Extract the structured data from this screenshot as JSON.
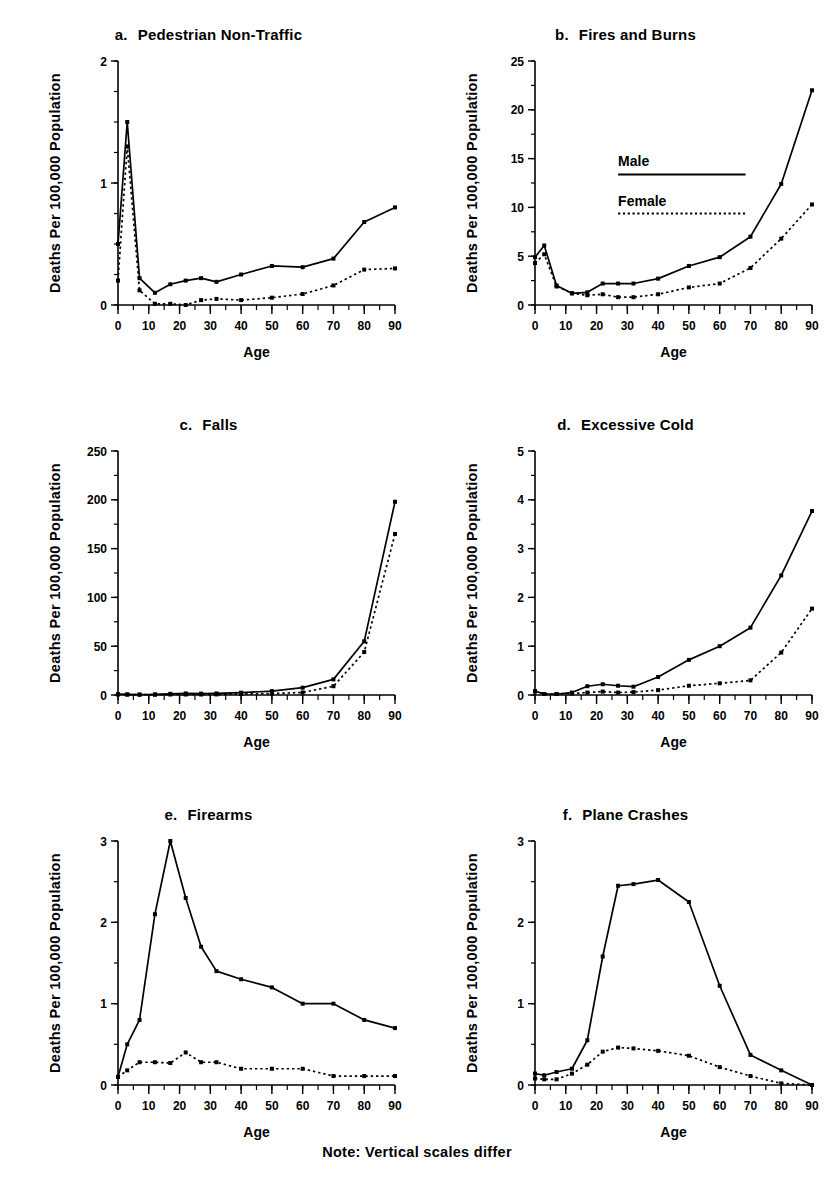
{
  "figure": {
    "footnote": "Note: Vertical scales differ",
    "axis_x_title": "Age",
    "axis_y_title": "Deaths Per 100,000 Population",
    "ink_color": "#000000",
    "background_color": "#ffffff"
  },
  "legend": {
    "male_label": "Male",
    "female_label": "Female",
    "panel": "b"
  },
  "chart_data": [
    {
      "type": "line",
      "panel_letter": "a.",
      "title": "Pedestrian Non-Traffic",
      "xlabel": "Age",
      "ylabel": "Deaths Per 100,000 Population",
      "xlim": [
        0,
        90
      ],
      "ylim": [
        0,
        2
      ],
      "xticks": [
        0,
        10,
        20,
        30,
        40,
        50,
        60,
        70,
        80,
        90
      ],
      "xticks_minor_step": 5,
      "yticks": [
        0,
        1,
        2
      ],
      "yticks_minor_step": 0.25,
      "grid": false,
      "legend_position": "none",
      "x": [
        0,
        3,
        7,
        12,
        17,
        22,
        27,
        32,
        40,
        50,
        60,
        70,
        80,
        90
      ],
      "series": [
        {
          "name": "Male",
          "style": "solid",
          "values": [
            0.5,
            1.5,
            0.22,
            0.1,
            0.17,
            0.2,
            0.22,
            0.19,
            0.25,
            0.32,
            0.31,
            0.38,
            0.68,
            0.8
          ]
        },
        {
          "name": "Female",
          "style": "dotted",
          "values": [
            0.2,
            1.3,
            0.12,
            0.01,
            0.01,
            0.0,
            0.04,
            0.05,
            0.04,
            0.06,
            0.09,
            0.16,
            0.29,
            0.3
          ]
        }
      ]
    },
    {
      "type": "line",
      "panel_letter": "b.",
      "title": "Fires and Burns",
      "xlabel": "Age",
      "ylabel": "Deaths Per 100,000 Population",
      "xlim": [
        0,
        90
      ],
      "ylim": [
        0,
        25
      ],
      "xticks": [
        0,
        10,
        20,
        30,
        40,
        50,
        60,
        70,
        80,
        90
      ],
      "xticks_minor_step": 5,
      "yticks": [
        0,
        5,
        10,
        15,
        20,
        25
      ],
      "yticks_minor_step": 2.5,
      "grid": false,
      "legend_position": "center",
      "x": [
        0,
        3,
        7,
        12,
        17,
        22,
        27,
        32,
        40,
        50,
        60,
        70,
        80,
        90
      ],
      "series": [
        {
          "name": "Male",
          "style": "solid",
          "values": [
            4.9,
            6.1,
            2.0,
            1.2,
            1.3,
            2.2,
            2.2,
            2.2,
            2.7,
            4.0,
            4.9,
            7.0,
            12.4,
            22.0
          ]
        },
        {
          "name": "Female",
          "style": "dotted",
          "values": [
            4.3,
            5.2,
            1.9,
            1.2,
            1.0,
            1.1,
            0.8,
            0.8,
            1.1,
            1.8,
            2.2,
            3.8,
            6.8,
            10.3
          ]
        }
      ]
    },
    {
      "type": "line",
      "panel_letter": "c.",
      "title": "Falls",
      "xlabel": "Age",
      "ylabel": "Deaths Per 100,000 Population",
      "xlim": [
        0,
        90
      ],
      "ylim": [
        0,
        250
      ],
      "xticks": [
        0,
        10,
        20,
        30,
        40,
        50,
        60,
        70,
        80,
        90
      ],
      "xticks_minor_step": 5,
      "yticks": [
        0,
        50,
        100,
        150,
        200,
        250
      ],
      "yticks_minor_step": 25,
      "grid": false,
      "legend_position": "none",
      "x": [
        0,
        3,
        7,
        12,
        17,
        22,
        27,
        32,
        40,
        50,
        60,
        70,
        80,
        90
      ],
      "series": [
        {
          "name": "Male",
          "style": "solid",
          "values": [
            0.8,
            0.6,
            0.5,
            0.6,
            1.2,
            1.6,
            1.4,
            1.6,
            2.4,
            4.0,
            7.5,
            16.0,
            55.0,
            198.0
          ]
        },
        {
          "name": "Female",
          "style": "dotted",
          "values": [
            0.6,
            0.4,
            0.3,
            0.3,
            0.5,
            0.5,
            0.5,
            0.6,
            1.0,
            1.5,
            2.6,
            9.0,
            44.0,
            165.0
          ]
        }
      ]
    },
    {
      "type": "line",
      "panel_letter": "d.",
      "title": "Excessive Cold",
      "xlabel": "Age",
      "ylabel": "Deaths Per 100,000 Population",
      "xlim": [
        0,
        90
      ],
      "ylim": [
        0,
        5
      ],
      "xticks": [
        0,
        10,
        20,
        30,
        40,
        50,
        60,
        70,
        80,
        90
      ],
      "xticks_minor_step": 5,
      "yticks": [
        0,
        1,
        2,
        3,
        4,
        5
      ],
      "yticks_minor_step": 0.5,
      "grid": false,
      "legend_position": "none",
      "x": [
        0,
        3,
        7,
        12,
        17,
        22,
        27,
        32,
        40,
        50,
        60,
        70,
        80,
        90
      ],
      "series": [
        {
          "name": "Male",
          "style": "solid",
          "values": [
            0.08,
            0.02,
            0.02,
            0.05,
            0.18,
            0.22,
            0.19,
            0.17,
            0.37,
            0.72,
            1.0,
            1.38,
            2.45,
            3.77
          ]
        },
        {
          "name": "Female",
          "style": "dotted",
          "values": [
            0.07,
            0.02,
            0.02,
            0.03,
            0.05,
            0.07,
            0.05,
            0.06,
            0.1,
            0.19,
            0.24,
            0.3,
            0.87,
            1.77
          ]
        }
      ]
    },
    {
      "type": "line",
      "panel_letter": "e.",
      "title": "Firearms",
      "xlabel": "Age",
      "ylabel": "Deaths Per 100,000 Population",
      "xlim": [
        0,
        90
      ],
      "ylim": [
        0,
        3
      ],
      "xticks": [
        0,
        10,
        20,
        30,
        40,
        50,
        60,
        70,
        80,
        90
      ],
      "xticks_minor_step": 5,
      "yticks": [
        0,
        1,
        2,
        3
      ],
      "yticks_minor_step": 0.5,
      "grid": false,
      "legend_position": "none",
      "x": [
        0,
        3,
        7,
        12,
        17,
        22,
        27,
        32,
        40,
        50,
        60,
        70,
        80,
        90
      ],
      "series": [
        {
          "name": "Male",
          "style": "solid",
          "values": [
            0.1,
            0.5,
            0.8,
            2.1,
            3.0,
            2.3,
            1.7,
            1.4,
            1.3,
            1.2,
            1.0,
            1.0,
            0.8,
            0.7
          ]
        },
        {
          "name": "Female",
          "style": "dotted",
          "values": [
            0.1,
            0.18,
            0.28,
            0.28,
            0.27,
            0.4,
            0.28,
            0.28,
            0.2,
            0.2,
            0.2,
            0.11,
            0.11,
            0.11
          ]
        }
      ]
    },
    {
      "type": "line",
      "panel_letter": "f.",
      "title": "Plane Crashes",
      "xlabel": "Age",
      "ylabel": "Deaths Per 100,000 Population",
      "xlim": [
        0,
        90
      ],
      "ylim": [
        0,
        3
      ],
      "xticks": [
        0,
        10,
        20,
        30,
        40,
        50,
        60,
        70,
        80,
        90
      ],
      "xticks_minor_step": 5,
      "yticks": [
        0,
        1,
        2,
        3
      ],
      "yticks_minor_step": 0.5,
      "grid": false,
      "legend_position": "none",
      "x": [
        0,
        3,
        7,
        12,
        17,
        22,
        27,
        32,
        40,
        50,
        60,
        70,
        80,
        90
      ],
      "series": [
        {
          "name": "Male",
          "style": "solid",
          "values": [
            0.14,
            0.12,
            0.16,
            0.2,
            0.55,
            1.58,
            2.45,
            2.47,
            2.52,
            2.25,
            1.22,
            0.37,
            0.18,
            0.0
          ]
        },
        {
          "name": "Female",
          "style": "dotted",
          "values": [
            0.08,
            0.07,
            0.07,
            0.14,
            0.25,
            0.41,
            0.46,
            0.45,
            0.42,
            0.36,
            0.22,
            0.11,
            0.02,
            0.0
          ]
        }
      ]
    }
  ]
}
